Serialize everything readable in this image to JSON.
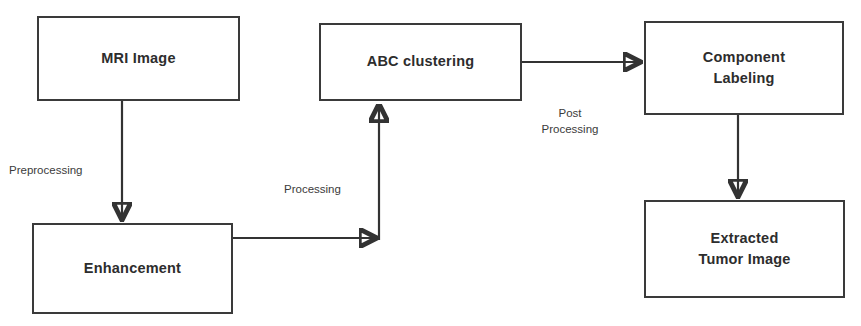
{
  "diagram": {
    "type": "flowchart",
    "background_color": "#ffffff",
    "stroke_color": "#333333",
    "text_color": "#2d2d2d",
    "nodes": [
      {
        "id": "mri-image",
        "label": "MRI Image",
        "x": 37,
        "y": 16,
        "width": 203,
        "height": 85
      },
      {
        "id": "enhancement",
        "label": "Enhancement",
        "x": 32,
        "y": 223,
        "width": 201,
        "height": 91
      },
      {
        "id": "abc-clustering",
        "label": "ABC clustering",
        "x": 319,
        "y": 23,
        "width": 203,
        "height": 78
      },
      {
        "id": "component-labeling",
        "label": "Component\nLabeling",
        "x": 644,
        "y": 21,
        "width": 200,
        "height": 94
      },
      {
        "id": "extracted-tumor-image",
        "label": "Extracted\nTumor Image",
        "x": 644,
        "y": 200,
        "width": 201,
        "height": 98
      }
    ],
    "edges": [
      {
        "id": "mri-to-enhancement",
        "from": "mri-image",
        "to": "enhancement",
        "label": "Preprocessing",
        "label_x": 9,
        "label_y": 163,
        "label_align": "left",
        "path": "M 122 101 L 122 222"
      },
      {
        "id": "enhancement-to-abc",
        "from": "enhancement",
        "to": "abc-clustering",
        "label": "Processing",
        "label_x": 284,
        "label_y": 182,
        "label_align": "center",
        "path": "M 233 238 L 379 238 M 379 238 L 379 102"
      },
      {
        "id": "abc-to-component",
        "from": "abc-clustering",
        "to": "component-labeling",
        "label": "Post\nProcessing",
        "label_x": 534,
        "label_y": 106,
        "label_align": "center",
        "path": "M 522 62 L 643 62"
      },
      {
        "id": "component-to-extracted",
        "from": "component-labeling",
        "to": "extracted-tumor-image",
        "label": "",
        "path": "M 738 115 L 738 199"
      }
    ]
  }
}
